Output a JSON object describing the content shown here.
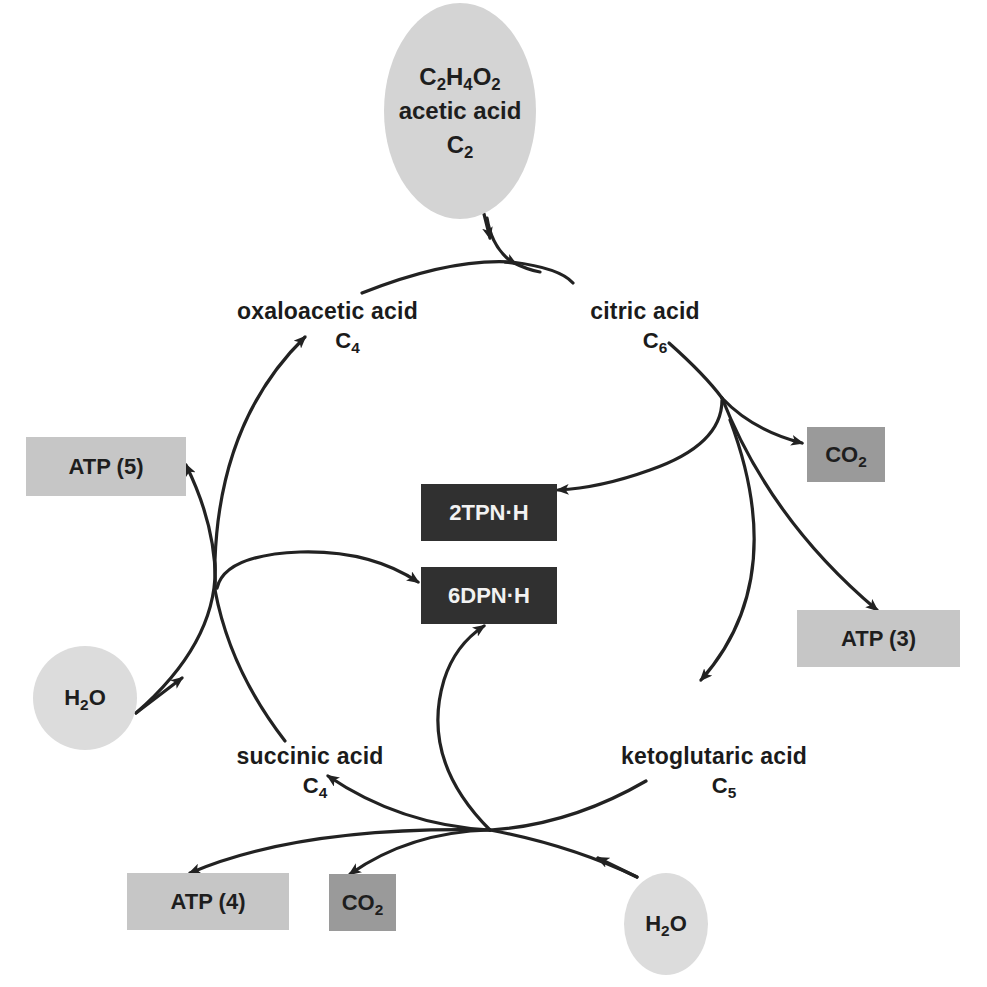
{
  "diagram": {
    "type": "metabolic-cycle",
    "name_inferred_from_content": "citric acid cycle",
    "colors": {
      "background": "#ffffff",
      "arrow": "#222222",
      "circle_fill_large": "#d4d4d4",
      "circle_fill_small": "#dcdcdc",
      "atp_box": "#c6c6c6",
      "co2_box": "#9a9a9a",
      "coenzyme_box": "#303030",
      "text": "#1b1b1b",
      "text_on_dark": "#f2f2f2"
    },
    "input": {
      "formula": {
        "base": [
          "C",
          "H",
          "O"
        ],
        "subs": [
          "2",
          "4",
          "2"
        ]
      },
      "name": "acetic acid",
      "carbon": {
        "base": "C",
        "sub": "2"
      }
    },
    "compounds": [
      {
        "id": "oxaloacetic",
        "name": "oxaloacetic acid",
        "carbon": {
          "base": "C",
          "sub": "4"
        }
      },
      {
        "id": "citric",
        "name": "citric acid",
        "carbon": {
          "base": "C",
          "sub": "6"
        }
      },
      {
        "id": "ketoglutaric",
        "name": "ketoglutaric acid",
        "carbon": {
          "base": "C",
          "sub": "5"
        }
      },
      {
        "id": "succinic",
        "name": "succinic acid",
        "carbon": {
          "base": "C",
          "sub": "4"
        }
      }
    ],
    "products": {
      "co2_right": {
        "base": "CO",
        "sub": "2"
      },
      "co2_bottom": {
        "base": "CO",
        "sub": "2"
      },
      "atp3": "ATP (3)",
      "atp4": "ATP (4)",
      "atp5": "ATP (5)",
      "tpnh": "2TPN·H",
      "dpnh": "6DPN·H"
    },
    "inputs_water": [
      {
        "id": "h2o_left",
        "base": "H",
        "sub": "2",
        "tail": "O"
      },
      {
        "id": "h2o_bottom",
        "base": "H",
        "sub": "2",
        "tail": "O"
      }
    ],
    "edges": [
      {
        "from": "acetic acid",
        "to": "citric acid"
      },
      {
        "from": "oxaloacetic acid",
        "to": "citric acid"
      },
      {
        "from": "citric acid",
        "to": "CO2"
      },
      {
        "from": "citric acid",
        "to": "2TPN·H"
      },
      {
        "from": "citric acid",
        "to": "ATP (3)"
      },
      {
        "from": "citric acid",
        "to": "ketoglutaric acid"
      },
      {
        "from": "ketoglutaric acid",
        "to": "succinic acid"
      },
      {
        "from": "ketoglutaric acid",
        "to": "6DPN·H"
      },
      {
        "from": "ketoglutaric acid",
        "to": "ATP (4)"
      },
      {
        "from": "ketoglutaric acid",
        "to": "CO2"
      },
      {
        "from": "H2O",
        "to": "succinic acid"
      },
      {
        "from": "succinic acid",
        "to": "oxaloacetic acid"
      },
      {
        "from": "succinic acid",
        "to": "6DPN·H"
      },
      {
        "from": "succinic acid",
        "to": "ATP (5)"
      },
      {
        "from": "H2O",
        "to": "oxaloacetic acid"
      }
    ]
  }
}
